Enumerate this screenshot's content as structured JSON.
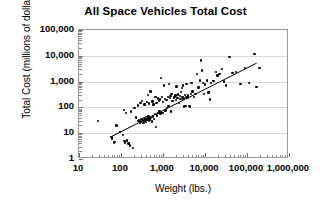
{
  "chart_data": {
    "type": "scatter",
    "title": "All Space Vehicles Total Cost",
    "xlabel": "Weight (lbs.)",
    "ylabel": "Total Cost (millions of dollars)",
    "xscale": "log",
    "yscale": "log",
    "xlim": [
      10,
      1000000
    ],
    "ylim": [
      1,
      100000
    ],
    "grid": true,
    "grid_axis": "y",
    "legend": null,
    "xticks": [
      10,
      100,
      1000,
      10000,
      100000,
      1000000
    ],
    "xtick_labels": [
      "10",
      "100",
      "1,000",
      "10,000",
      "100,000",
      "1,000,000"
    ],
    "yticks": [
      1,
      10,
      100,
      1000,
      10000,
      100000
    ],
    "ytick_labels": [
      "1",
      "10",
      "100",
      "1,000",
      "10,000",
      "100,000"
    ],
    "marker": "filled-circle",
    "marker_color": "#000000",
    "trendline": {
      "type": "log-log-linear",
      "color": "#000000",
      "x_start": 60,
      "y_start": 7.5,
      "x_end": 170000,
      "y_end": 5200
    },
    "points": [
      [
        28,
        30
      ],
      [
        60,
        7.0
      ],
      [
        62,
        6.2
      ],
      [
        68,
        4.2
      ],
      [
        70,
        4.6
      ],
      [
        78,
        20
      ],
      [
        95,
        11
      ],
      [
        110,
        8.5
      ],
      [
        118,
        80
      ],
      [
        120,
        5.0
      ],
      [
        125,
        4.4
      ],
      [
        130,
        60
      ],
      [
        140,
        5.2
      ],
      [
        150,
        4.0
      ],
      [
        165,
        3.3
      ],
      [
        175,
        70
      ],
      [
        190,
        2.7
      ],
      [
        210,
        95
      ],
      [
        230,
        40
      ],
      [
        250,
        120
      ],
      [
        260,
        30
      ],
      [
        270,
        33
      ],
      [
        280,
        26
      ],
      [
        290,
        150
      ],
      [
        300,
        28
      ],
      [
        310,
        35
      ],
      [
        320,
        180
      ],
      [
        330,
        31
      ],
      [
        340,
        25
      ],
      [
        350,
        38
      ],
      [
        360,
        130
      ],
      [
        370,
        29
      ],
      [
        380,
        34
      ],
      [
        390,
        42
      ],
      [
        400,
        27
      ],
      [
        410,
        36
      ],
      [
        420,
        160
      ],
      [
        430,
        33
      ],
      [
        440,
        300
      ],
      [
        450,
        45
      ],
      [
        460,
        30
      ],
      [
        470,
        140
      ],
      [
        480,
        37
      ],
      [
        490,
        32
      ],
      [
        500,
        410
      ],
      [
        520,
        39
      ],
      [
        540,
        28
      ],
      [
        560,
        170
      ],
      [
        580,
        44
      ],
      [
        600,
        130
      ],
      [
        620,
        35
      ],
      [
        640,
        55
      ],
      [
        660,
        260
      ],
      [
        680,
        17
      ],
      [
        700,
        150
      ],
      [
        720,
        48
      ],
      [
        750,
        220
      ],
      [
        780,
        60
      ],
      [
        800,
        180
      ],
      [
        820,
        70
      ],
      [
        850,
        200
      ],
      [
        880,
        58
      ],
      [
        900,
        1350
      ],
      [
        950,
        250
      ],
      [
        980,
        62
      ],
      [
        1000,
        160
      ],
      [
        1050,
        700
      ],
      [
        1100,
        210
      ],
      [
        1150,
        75
      ],
      [
        1200,
        190
      ],
      [
        1250,
        95
      ],
      [
        1300,
        250
      ],
      [
        1350,
        115
      ],
      [
        1400,
        800
      ],
      [
        1450,
        230
      ],
      [
        1500,
        280
      ],
      [
        1550,
        70
      ],
      [
        1600,
        330
      ],
      [
        1700,
        180
      ],
      [
        1800,
        240
      ],
      [
        1900,
        260
      ],
      [
        2000,
        290
      ],
      [
        2050,
        195
      ],
      [
        2100,
        640
      ],
      [
        2200,
        230
      ],
      [
        2300,
        320
      ],
      [
        2400,
        150
      ],
      [
        2500,
        270
      ],
      [
        2600,
        210
      ],
      [
        2700,
        400
      ],
      [
        2800,
        560
      ],
      [
        2900,
        250
      ],
      [
        3000,
        700
      ],
      [
        3100,
        220
      ],
      [
        3200,
        110
      ],
      [
        3300,
        300
      ],
      [
        3400,
        115
      ],
      [
        3500,
        260
      ],
      [
        3600,
        830
      ],
      [
        3800,
        240
      ],
      [
        4000,
        290
      ],
      [
        4200,
        115
      ],
      [
        4400,
        110
      ],
      [
        4600,
        330
      ],
      [
        4800,
        900
      ],
      [
        5000,
        420
      ],
      [
        5500,
        250
      ],
      [
        6000,
        330
      ],
      [
        6500,
        2000
      ],
      [
        7000,
        600
      ],
      [
        7500,
        1100
      ],
      [
        8000,
        6500
      ],
      [
        8500,
        2700
      ],
      [
        9000,
        900
      ],
      [
        9500,
        340
      ],
      [
        10000,
        780
      ],
      [
        11000,
        1100
      ],
      [
        12000,
        380
      ],
      [
        13000,
        200
      ],
      [
        14000,
        900
      ],
      [
        16000,
        1050
      ],
      [
        18000,
        2300
      ],
      [
        20000,
        1700
      ],
      [
        22000,
        2000
      ],
      [
        25000,
        3100
      ],
      [
        28000,
        1000
      ],
      [
        32000,
        700
      ],
      [
        38000,
        9000
      ],
      [
        45000,
        2100
      ],
      [
        55000,
        2300
      ],
      [
        70000,
        800
      ],
      [
        90000,
        3300
      ],
      [
        110000,
        900
      ],
      [
        150000,
        12000
      ],
      [
        170000,
        630
      ],
      [
        200000,
        3400
      ]
    ]
  }
}
